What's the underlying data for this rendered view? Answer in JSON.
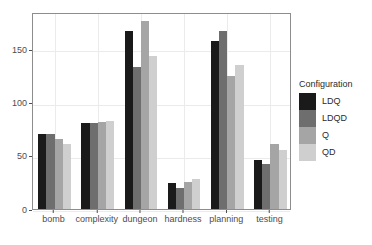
{
  "chart_data": {
    "type": "bar",
    "title": "",
    "xlabel": "",
    "ylabel": "",
    "grid": true,
    "ylim": [
      0,
      185
    ],
    "yticks": [
      0,
      50,
      100,
      150
    ],
    "ytick_labels": [
      "0",
      "50",
      "100",
      "150"
    ],
    "categories": [
      "bomb",
      "complexity",
      "dungeon",
      "hardness",
      "planning",
      "testing"
    ],
    "legend": {
      "title": "Configuration",
      "position": "right",
      "entries": [
        {
          "name": "LDQ",
          "color": "#1a1a1a"
        },
        {
          "name": "LDQD",
          "color": "#6e6e6e"
        },
        {
          "name": "Q",
          "color": "#a5a5a5"
        },
        {
          "name": "QD",
          "color": "#cfcfcf"
        }
      ]
    },
    "series": [
      {
        "name": "LDQ",
        "color": "#1a1a1a",
        "values": [
          70,
          81,
          167,
          24,
          158,
          46
        ]
      },
      {
        "name": "LDQD",
        "color": "#6e6e6e",
        "values": [
          70,
          81,
          133,
          20,
          167,
          42
        ]
      },
      {
        "name": "Q",
        "color": "#a5a5a5",
        "values": [
          66,
          82,
          177,
          25,
          125,
          61
        ]
      },
      {
        "name": "QD",
        "color": "#cfcfcf",
        "values": [
          61,
          83,
          144,
          28,
          135,
          55
        ]
      }
    ]
  }
}
